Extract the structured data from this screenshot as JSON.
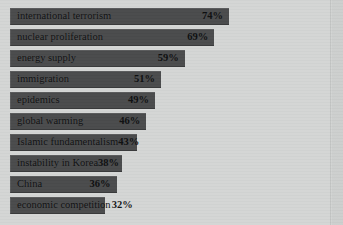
{
  "chart": {
    "title_clipped": "2006",
    "panel_width_px": 331,
    "value_suffix": "%"
  },
  "colors": {
    "background": "#d2d4d3",
    "panel": "#d4d6d5",
    "bar_fill": "#4a4b4c",
    "text": "#0e0f10"
  },
  "chart_data": {
    "type": "bar",
    "orientation": "horizontal",
    "title": "2006",
    "xlabel": "",
    "ylabel": "",
    "xlim": [
      0,
      100
    ],
    "grid": false,
    "legend": false,
    "value_format": "{v}%",
    "categories": [
      "international terrorism",
      "nuclear proliferation",
      "energy supply",
      "immigration",
      "epidemics",
      "global warming",
      "Islamic fundamentalism",
      "instability in Korea",
      "China",
      "economic competition"
    ],
    "values": [
      74,
      69,
      59,
      51,
      49,
      46,
      43,
      38,
      36,
      32
    ],
    "bars": [
      {
        "label": "international terrorism",
        "value": 74,
        "value_text": "74%",
        "label_inside": true,
        "value_inside": true
      },
      {
        "label": "nuclear proliferation",
        "value": 69,
        "value_text": "69%",
        "label_inside": true,
        "value_inside": true
      },
      {
        "label": "energy supply",
        "value": 59,
        "value_text": "59%",
        "label_inside": true,
        "value_inside": true
      },
      {
        "label": "immigration",
        "value": 51,
        "value_text": "51%",
        "label_inside": true,
        "value_inside": true
      },
      {
        "label": "epidemics",
        "value": 49,
        "value_text": "49%",
        "label_inside": true,
        "value_inside": true
      },
      {
        "label": "global warming",
        "value": 46,
        "value_text": "46%",
        "label_inside": true,
        "value_inside": true
      },
      {
        "label": "Islamic fundamentalism",
        "value": 43,
        "value_text": "43%",
        "label_inside": true,
        "value_inside": true
      },
      {
        "label": "instability in Korea",
        "value": 38,
        "value_text": "38%",
        "label_inside": true,
        "value_inside": true
      },
      {
        "label": "China",
        "value": 36,
        "value_text": "36%",
        "label_inside": true,
        "value_inside": true
      },
      {
        "label": "economic competition",
        "value": 32,
        "value_text": "32%",
        "label_inside": true,
        "value_inside": false
      }
    ]
  }
}
